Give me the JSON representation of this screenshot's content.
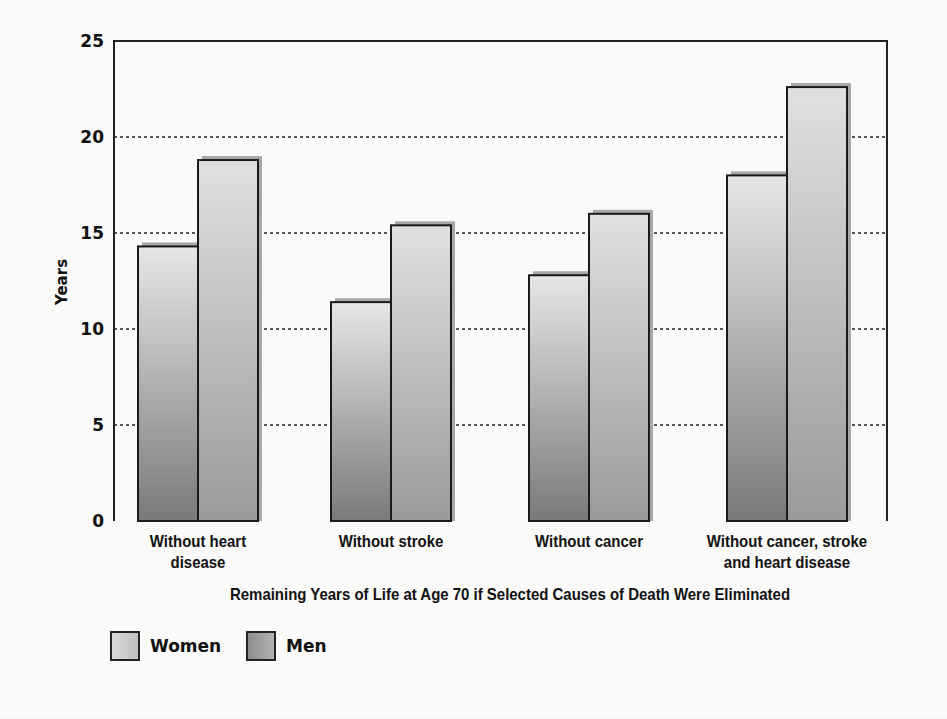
{
  "chart_data": {
    "type": "bar",
    "title": "",
    "xlabel": "Remaining Years of Life at  Age 70 if Selected Causes of Death Were Eliminated",
    "ylabel": "Years",
    "ylim": [
      0,
      25
    ],
    "yticks": [
      "0",
      "5",
      "10",
      "15",
      "20",
      "25"
    ],
    "grid": "horizontal dotted at 5, 10, 15, 20",
    "legend_position": "bottom-left",
    "categories": [
      "Without heart\ndisease",
      "Without stroke",
      "Without cancer",
      "Without cancer, stroke\nand heart disease"
    ],
    "series": [
      {
        "name": "Women",
        "values": [
          14.3,
          11.4,
          12.8,
          18.0
        ],
        "color": "#c8c8c8"
      },
      {
        "name": "Men",
        "values": [
          18.8,
          15.4,
          16.0,
          22.6
        ],
        "color": "#a0a0a0"
      }
    ]
  },
  "legend": {
    "items": [
      {
        "label": "Women"
      },
      {
        "label": "Men"
      }
    ]
  }
}
